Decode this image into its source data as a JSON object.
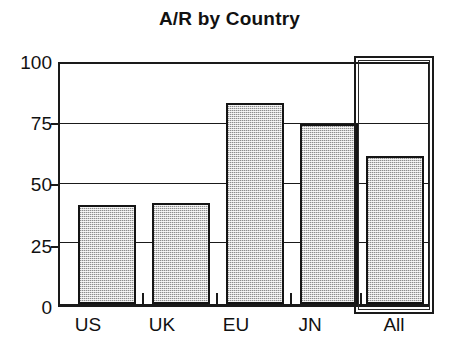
{
  "chart_data": {
    "type": "bar",
    "title": "A/R by Country",
    "xlabel": "",
    "ylabel": "",
    "categories": [
      "US",
      "UK",
      "EU",
      "JN",
      "All"
    ],
    "values": [
      42,
      42.5,
      85,
      76,
      62.5
    ],
    "ylim": [
      0,
      100
    ],
    "yticks": [
      0,
      25,
      50,
      75,
      100
    ],
    "ytick_labels": [
      "0",
      "25",
      "50",
      "75",
      "100"
    ],
    "grid": true,
    "legend": false,
    "bar_fill_color": "#d0d0d0",
    "bar_edge_color": "#141414",
    "axis_color": "#1a1a1a",
    "background_color": "#ffffff",
    "annotations": [
      {
        "name": "selection-box",
        "target_category": "All",
        "style": "double-rectangle-outline"
      }
    ]
  }
}
